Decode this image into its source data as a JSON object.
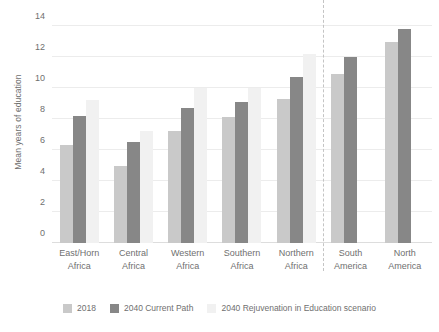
{
  "chart_data": {
    "type": "bar",
    "title": "",
    "xlabel": "",
    "ylabel": "Mean years of education",
    "ylim": [
      0,
      14
    ],
    "yticks": [
      0,
      2,
      4,
      6,
      8,
      10,
      12,
      14
    ],
    "grid": true,
    "legend_position": "bottom",
    "categories": [
      "East/Horn\nAfrica",
      "Central\nAfrica",
      "Western\nAfrica",
      "Southern\nAfrica",
      "Northern\nAfrica",
      "South\nAmerica",
      "North\nAmerica"
    ],
    "category_lines": [
      [
        "East/Horn",
        "Africa"
      ],
      [
        "Central",
        "Africa"
      ],
      [
        "Western",
        "Africa"
      ],
      [
        "Southern",
        "Africa"
      ],
      [
        "Northern",
        "Africa"
      ],
      [
        "South",
        "America"
      ],
      [
        "North",
        "America"
      ]
    ],
    "series": [
      {
        "name": "2018",
        "color": "#c9c9c9",
        "values": [
          6.3,
          5.0,
          7.2,
          8.1,
          9.3,
          10.9,
          13.0
        ]
      },
      {
        "name": "2040 Current Path",
        "color": "#878787",
        "values": [
          8.2,
          6.5,
          8.7,
          9.1,
          10.7,
          12.0,
          13.8
        ]
      },
      {
        "name": "2040 Rejuvenation in Education scenario",
        "color": "#f1f1f1",
        "values": [
          9.2,
          7.2,
          10.0,
          10.0,
          12.2,
          null,
          null
        ]
      }
    ],
    "annotations": {
      "separator_after_category_index": 4,
      "separator_style": "dashed vertical line"
    }
  },
  "legend": {
    "items": [
      {
        "label": "2018",
        "color": "#c9c9c9"
      },
      {
        "label": "2040 Current Path",
        "color": "#878787"
      },
      {
        "label": "2040 Rejuvenation in Education scenario",
        "color": "#f1f1f1"
      }
    ]
  }
}
